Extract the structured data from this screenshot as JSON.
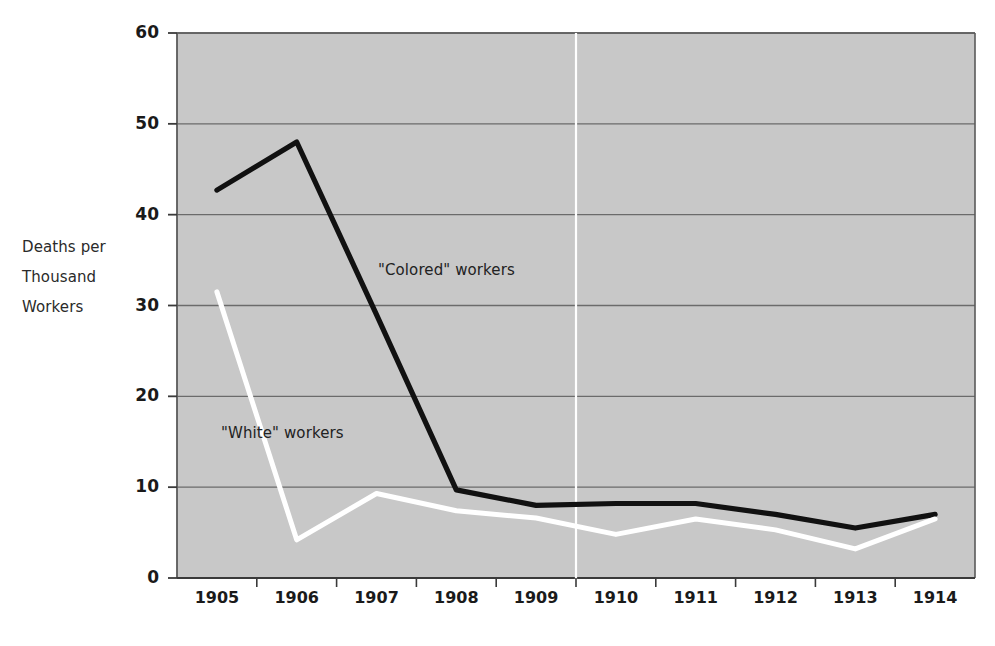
{
  "axis_label": {
    "line1": "Deaths per",
    "line2": "Thousand",
    "line3": "Workers"
  },
  "series_labels": {
    "colored": "\"Colored\" workers",
    "white": "\"White\" workers"
  },
  "colors": {
    "plot_background": "#c8c8c8",
    "plot_border": "#5a5a5a",
    "gridline": "#6b6b6b",
    "colored_line": "#111111",
    "white_line": "#ffffff",
    "marker_line": "#ffffff",
    "text": "#1a1a1a"
  },
  "chart_data": {
    "type": "line",
    "title": "",
    "xlabel": "",
    "ylabel": "Deaths per Thousand Workers",
    "categories": [
      "1905",
      "1906",
      "1907",
      "1908",
      "1909",
      "1910",
      "1911",
      "1912",
      "1913",
      "1914"
    ],
    "x": [
      1905,
      1906,
      1907,
      1908,
      1909,
      1910,
      1911,
      1912,
      1913,
      1914
    ],
    "ylim": [
      0,
      60
    ],
    "yticks": [
      0,
      10,
      20,
      30,
      40,
      50,
      60
    ],
    "ytick_labels": [
      "0",
      "10",
      "20",
      "30",
      "40",
      "50",
      "60"
    ],
    "grid": true,
    "legend": "inline-annotations",
    "series": [
      {
        "name": "\"Colored\" workers",
        "color": "#111111",
        "values": [
          42.7,
          48.0,
          29.0,
          9.7,
          8.0,
          8.2,
          8.2,
          7.0,
          5.5,
          7.0
        ]
      },
      {
        "name": "\"White\" workers",
        "color": "#ffffff",
        "values": [
          31.5,
          4.2,
          9.3,
          7.4,
          6.6,
          4.8,
          6.5,
          5.3,
          3.2,
          6.5
        ]
      }
    ],
    "annotations": [
      {
        "text": "\"Colored\" workers",
        "x": 1907.0,
        "y": 35.5
      },
      {
        "text": "\"White\" workers",
        "x": 1905.9,
        "y": 17.0
      },
      {
        "type": "vertical-reference-line",
        "x": 1909.5,
        "color": "#ffffff"
      }
    ]
  }
}
